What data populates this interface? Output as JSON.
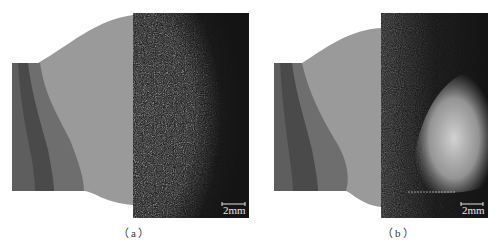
{
  "figure": {
    "panels": [
      {
        "id": "a",
        "caption": "（a）",
        "scale_bar_label": "2mm",
        "colors": {
          "weld_gray": "#9a9a9a",
          "plate_light": "#7a7a7a",
          "plate_mid": "#5e5e5e",
          "plate_dark": "#444444",
          "micrograph_bg": "#141414"
        }
      },
      {
        "id": "b",
        "caption": "（b）",
        "scale_bar_label": "2mm",
        "colors": {
          "weld_gray": "#9a9a9a",
          "plate_light": "#7a7a7a",
          "plate_mid": "#5e5e5e",
          "plate_dark": "#444444",
          "micrograph_bg": "#141414"
        }
      }
    ]
  }
}
